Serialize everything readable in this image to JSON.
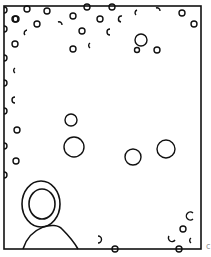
{
  "drawing": {
    "stroke": "#111111",
    "background": "#ffffff",
    "frame": {
      "x": 4,
      "y": 6,
      "w": 197,
      "h": 243
    },
    "circles": [
      {
        "cx": 15,
        "cy": 19,
        "r": 3
      },
      {
        "cx": 27,
        "cy": 9,
        "r": 3
      },
      {
        "cx": 47,
        "cy": 11,
        "r": 3
      },
      {
        "cx": 16,
        "cy": 19,
        "r": 3
      },
      {
        "cx": 37,
        "cy": 24,
        "r": 3
      },
      {
        "cx": 73,
        "cy": 16,
        "r": 3
      },
      {
        "cx": 100,
        "cy": 19,
        "r": 3
      },
      {
        "cx": 82,
        "cy": 31,
        "r": 3
      },
      {
        "cx": 15,
        "cy": 44,
        "r": 3
      },
      {
        "cx": 73,
        "cy": 49,
        "r": 3
      },
      {
        "cx": 87,
        "cy": 7,
        "r": 3
      },
      {
        "cx": 112,
        "cy": 7,
        "r": 3
      },
      {
        "cx": 182,
        "cy": 13,
        "r": 3
      },
      {
        "cx": 194,
        "cy": 24,
        "r": 3
      },
      {
        "cx": 141,
        "cy": 40,
        "r": 6
      },
      {
        "cx": 137,
        "cy": 50,
        "r": 2.5
      },
      {
        "cx": 157,
        "cy": 50,
        "r": 3
      },
      {
        "cx": 71,
        "cy": 120,
        "r": 6
      },
      {
        "cx": 17,
        "cy": 130,
        "r": 3
      },
      {
        "cx": 16,
        "cy": 161,
        "r": 3
      },
      {
        "cx": 74,
        "cy": 147,
        "r": 10
      },
      {
        "cx": 133,
        "cy": 157,
        "r": 8
      },
      {
        "cx": 166,
        "cy": 149,
        "r": 9
      },
      {
        "cx": 183,
        "cy": 229,
        "r": 3
      },
      {
        "cx": 115,
        "cy": 249,
        "r": 3
      },
      {
        "cx": 179,
        "cy": 249,
        "r": 3
      }
    ],
    "arcs": [
      {
        "d": "M4,7 A3,3 0 0 1 4,13"
      },
      {
        "d": "M4,26 A3,3 0 0 1 4,32"
      },
      {
        "d": "M4,55 A3,3 0 0 1 4,61"
      },
      {
        "d": "M4,80 A3,3 0 0 1 4,86"
      },
      {
        "d": "M4,108 A3,3 0 0 1 4,114"
      },
      {
        "d": "M4,143 A3,3 0 0 1 4,149"
      },
      {
        "d": "M4,172 A3,3 0 0 1 4,178"
      },
      {
        "d": "M27,30 A3,3 0 0 0 25,35"
      },
      {
        "d": "M58,22 A3,3 0 0 1 62,25"
      },
      {
        "d": "M122,16 A3,3 0 0 0 121,22"
      },
      {
        "d": "M137,10 A3,3 0 0 0 136,15"
      },
      {
        "d": "M156,8 A3,3 0 0 1 160,11"
      },
      {
        "d": "M110,29 A3,3 0 0 0 110,35"
      },
      {
        "d": "M90,43 A3,3 0 0 0 90,48"
      },
      {
        "d": "M15,68 A3,3 0 0 0 15,73"
      },
      {
        "d": "M15,97 A3,3 0 0 0 15,103"
      },
      {
        "d": "M98,236 A3,3 0 0 1 98,243"
      },
      {
        "d": "M193,213 A4,4 0 1 0 193,219"
      },
      {
        "d": "M169,236 A3,3 0 0 0 175,240"
      },
      {
        "d": "M191,238 A3,3 0 0 0 191,243"
      }
    ],
    "concentric": {
      "cx": 41,
      "cy": 204,
      "r_outer_x": 19,
      "r_outer_y": 23,
      "r_inner_x": 13,
      "r_inner_y": 15
    },
    "dome": {
      "d": "M23,249 C30,226 55,221 62,229 C68,235 74,242 78,249"
    },
    "corner_mark": {
      "text": "c",
      "x": 206,
      "y": 249,
      "color": "#999999"
    }
  }
}
